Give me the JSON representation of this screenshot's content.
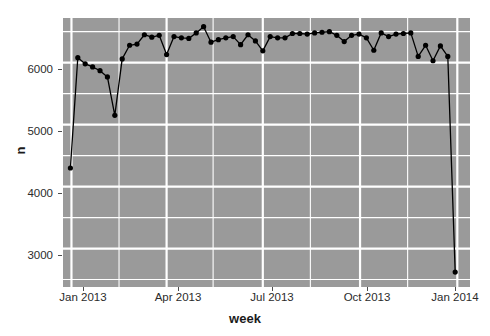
{
  "chart_data": {
    "type": "line",
    "title": "",
    "subtitle": "",
    "xlabel": "week",
    "ylabel": "n",
    "grid": true,
    "legend": false,
    "legend_position": "none",
    "marker": "filled-circle",
    "line_color": "#000000",
    "point_color": "#000000",
    "panel_background": "#9a9a9a",
    "gridline_color": "#ffffff",
    "xlim": [
      "2012-12-24",
      "2014-01-13"
    ],
    "ylim": [
      2380,
      6720
    ],
    "xticks": [
      "Jan 2013",
      "Apr 2013",
      "Jul 2013",
      "Oct 2013",
      "Jan 2014"
    ],
    "xtick_dates": [
      "2013-01-01",
      "2013-04-01",
      "2013-07-01",
      "2013-10-01",
      "2014-01-01"
    ],
    "yticks": [
      3000,
      4000,
      5000,
      6000
    ],
    "ytick_labels": [
      "3000",
      "4000",
      "5000",
      "6000"
    ],
    "yminor": [
      2500,
      3500,
      4500,
      5500,
      6500
    ],
    "x": [
      "2012-12-31",
      "2013-01-07",
      "2013-01-14",
      "2013-01-21",
      "2013-01-28",
      "2013-02-04",
      "2013-02-11",
      "2013-02-18",
      "2013-02-25",
      "2013-03-04",
      "2013-03-11",
      "2013-03-18",
      "2013-03-25",
      "2013-04-01",
      "2013-04-08",
      "2013-04-15",
      "2013-04-22",
      "2013-04-29",
      "2013-05-06",
      "2013-05-13",
      "2013-05-20",
      "2013-05-27",
      "2013-06-03",
      "2013-06-10",
      "2013-06-17",
      "2013-06-24",
      "2013-07-01",
      "2013-07-08",
      "2013-07-15",
      "2013-07-22",
      "2013-07-29",
      "2013-08-05",
      "2013-08-12",
      "2013-08-19",
      "2013-08-26",
      "2013-09-02",
      "2013-09-09",
      "2013-09-16",
      "2013-09-23",
      "2013-09-30",
      "2013-10-07",
      "2013-10-14",
      "2013-10-21",
      "2013-10-28",
      "2013-11-04",
      "2013-11-11",
      "2013-11-18",
      "2013-11-25",
      "2013-12-02",
      "2013-12-09",
      "2013-12-16",
      "2013-12-23",
      "2013-12-30"
    ],
    "values": [
      4300,
      6080,
      5980,
      5930,
      5870,
      5770,
      5150,
      6060,
      6280,
      6300,
      6450,
      6410,
      6440,
      6130,
      6420,
      6400,
      6390,
      6480,
      6580,
      6330,
      6370,
      6400,
      6420,
      6290,
      6450,
      6350,
      6190,
      6420,
      6400,
      6400,
      6470,
      6470,
      6460,
      6480,
      6490,
      6500,
      6440,
      6340,
      6440,
      6460,
      6400,
      6200,
      6480,
      6420,
      6460,
      6470,
      6480,
      6100,
      6280,
      6030,
      6270,
      6100,
      2620
    ],
    "n_points": 53
  },
  "axis": {
    "y_title": "n",
    "x_title": "week"
  }
}
